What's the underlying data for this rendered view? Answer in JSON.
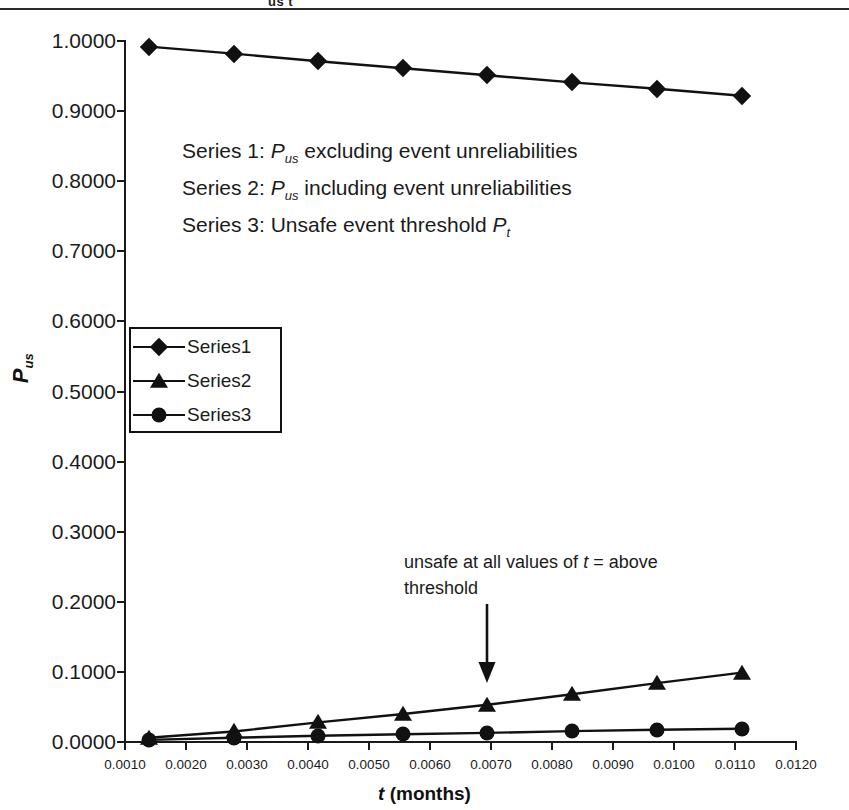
{
  "figure": {
    "caption_remnant": "us            t",
    "y_axis_title_main": "P",
    "y_axis_title_sub": "us",
    "x_axis_title_var": "t",
    "x_axis_title_unit": " (months)"
  },
  "annotations": {
    "series_notes": [
      {
        "prefix": "Series 1: ",
        "symbol": "P",
        "symbol_sub": "us",
        "suffix": " excluding event unreliabilities"
      },
      {
        "prefix": "Series 2: ",
        "symbol": "P",
        "symbol_sub": "us",
        "suffix": " including event unreliabilities"
      },
      {
        "prefix": "Series 3: Unsafe event threshold ",
        "symbol": "P",
        "symbol_sub": "t",
        "suffix": ""
      }
    ],
    "threshold_note": {
      "line1_a": "unsafe at all values of ",
      "line1_var": "t",
      "line1_b": " = above",
      "line2": "threshold"
    }
  },
  "legend": {
    "entries": [
      {
        "label": "Series1",
        "marker": "diamond-marker-icon"
      },
      {
        "label": "Series2",
        "marker": "triangle-marker-icon"
      },
      {
        "label": "Series3",
        "marker": "circle-marker-icon"
      }
    ]
  },
  "chart_data": {
    "type": "line",
    "title": "",
    "xlabel": "t (months)",
    "ylabel": "Pus",
    "xlim": [
      0.001,
      0.012
    ],
    "ylim": [
      0.0,
      1.0
    ],
    "grid": false,
    "legend_position": "inside-left",
    "x_tick_labels": [
      "0.0010",
      "0.0020",
      "0.0030",
      "0.0040",
      "0.0050",
      "0.0060",
      "0.0070",
      "0.0080",
      "0.0090",
      "0.0100",
      "0.0110",
      "0.0120"
    ],
    "x_ticks": [
      0.001,
      0.002,
      0.003,
      0.004,
      0.005,
      0.006,
      0.007,
      0.008,
      0.009,
      0.01,
      0.011,
      0.012
    ],
    "y_tick_labels": [
      "0.0000",
      "0.1000",
      "0.2000",
      "0.3000",
      "0.4000",
      "0.5000",
      "0.6000",
      "0.7000",
      "0.8000",
      "0.9000",
      "1.0000"
    ],
    "y_ticks": [
      0.0,
      0.1,
      0.2,
      0.3,
      0.4,
      0.5,
      0.6,
      0.7,
      0.8,
      0.9,
      1.0
    ],
    "x": [
      0.00139,
      0.00278,
      0.00417,
      0.00556,
      0.00694,
      0.00833,
      0.00972,
      0.01111
    ],
    "series": [
      {
        "name": "Series1",
        "marker": "diamond",
        "values": [
          0.992,
          0.982,
          0.971,
          0.961,
          0.951,
          0.941,
          0.932,
          0.922
        ]
      },
      {
        "name": "Series2",
        "marker": "triangle",
        "values": [
          0.006,
          0.015,
          0.028,
          0.04,
          0.053,
          0.068,
          0.084,
          0.099
        ]
      },
      {
        "name": "Series3",
        "marker": "circle",
        "values": [
          0.003,
          0.006,
          0.009,
          0.011,
          0.013,
          0.0155,
          0.0175,
          0.019
        ]
      }
    ],
    "annotation_arrow": {
      "at_x": 0.00694,
      "text": "unsafe at all values of t = above threshold"
    }
  }
}
